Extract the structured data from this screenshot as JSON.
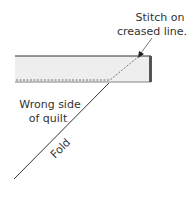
{
  "diagram": {
    "labels": {
      "stitch_line1": "Stitch on",
      "stitch_line2": "creased line.",
      "wrong_side_line1": "Wrong side",
      "wrong_side_line2": "of quilt",
      "fold": "Fold"
    },
    "colors": {
      "strip_fill": "#eeeeee",
      "strip_edge": "#333333",
      "right_edge": "#555555",
      "line": "#333333",
      "stitch": "#777777",
      "text": "#333333"
    }
  }
}
